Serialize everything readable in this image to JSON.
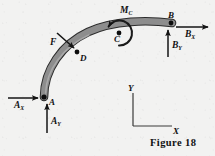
{
  "figure": {
    "caption": "Figure 18",
    "background_color": "#f2f2f1",
    "beam_fill_color": "#8d8d8d",
    "beam_stroke_color": "#2b2b2b",
    "ink_color": "#111111"
  },
  "points": [
    {
      "id": "A",
      "label": "A",
      "x": 44,
      "y": 97
    },
    {
      "id": "B",
      "label": "B",
      "x": 171,
      "y": 23
    },
    {
      "id": "C",
      "label": "C",
      "x": 119,
      "y": 33
    },
    {
      "id": "D",
      "label": "D",
      "x": 77,
      "y": 52
    }
  ],
  "forces": [
    {
      "id": "AX",
      "name": "A_X",
      "symbol": "A",
      "subscript": "X",
      "direction": "right",
      "applied_at": "A",
      "tail": {
        "x": 8,
        "y": 98
      },
      "head": {
        "x": 38,
        "y": 98
      }
    },
    {
      "id": "AY",
      "name": "A_Y",
      "symbol": "A",
      "subscript": "Y",
      "direction": "up",
      "applied_at": "A",
      "tail": {
        "x": 47,
        "y": 133
      },
      "head": {
        "x": 47,
        "y": 104
      }
    },
    {
      "id": "BX",
      "name": "B_X",
      "symbol": "B",
      "subscript": "X",
      "direction": "right",
      "applied_at": "B",
      "tail": {
        "x": 176,
        "y": 27
      },
      "head": {
        "x": 208,
        "y": 27
      }
    },
    {
      "id": "BY",
      "name": "B_Y",
      "symbol": "B",
      "subscript": "Y",
      "direction": "up",
      "applied_at": "B",
      "tail": {
        "x": 168,
        "y": 57
      },
      "head": {
        "x": 168,
        "y": 30
      }
    },
    {
      "id": "F",
      "name": "F",
      "symbol": "F",
      "subscript": "",
      "direction": "down-right",
      "applied_at": "D",
      "tail": {
        "x": 57,
        "y": 33
      },
      "head": {
        "x": 75,
        "y": 49
      }
    }
  ],
  "moment": {
    "id": "MC",
    "name": "M_C",
    "symbol": "M",
    "subscript": "C",
    "applied_at": "C",
    "sense": "counterclockwise",
    "center": {
      "x": 119,
      "y": 33
    },
    "radius": 12
  },
  "axes": {
    "origin": {
      "x": 133,
      "y": 126
    },
    "x_label": "X",
    "y_label": "Y",
    "x_end": {
      "x": 172,
      "y": 126
    },
    "y_end": {
      "x": 133,
      "y": 93
    }
  },
  "beam": {
    "shape": "curved-arc",
    "start": "A",
    "end": "B",
    "thickness": 6
  }
}
